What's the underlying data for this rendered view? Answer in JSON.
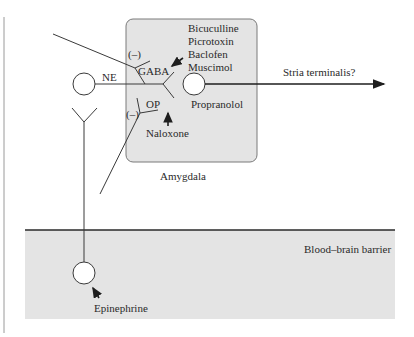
{
  "diagram": {
    "regions": {
      "amygdala": "Amygdala",
      "blood_brain_barrier": "Blood–brain barrier"
    },
    "neurons": {
      "ne": "NE",
      "gaba": "GABA",
      "op": "OP",
      "gaba_sign": "(–)",
      "op_sign": "(–)"
    },
    "drugs": {
      "gaba_agents": [
        "Bicuculline",
        "Picrotoxin",
        "Baclofen",
        "Muscimol"
      ],
      "opioid_agent": "Naloxone",
      "beta_blocker": "Propranolol",
      "hormone": "Epinephrine"
    },
    "pathway": {
      "output": "Stria terminalis?"
    },
    "colors": {
      "region_fill": "#e4e4e4",
      "line": "#3a3a3a"
    }
  }
}
